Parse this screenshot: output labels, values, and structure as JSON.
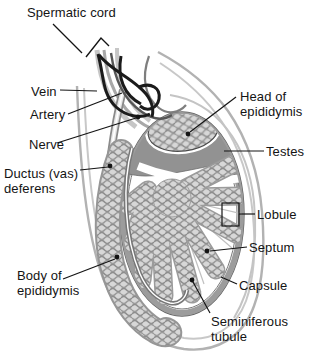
{
  "labels": {
    "spermatic_cord": "Spermatic cord",
    "vein": "Vein",
    "artery": "Artery",
    "nerve": "Nerve",
    "ductus_deferens": {
      "line1": "Ductus (vas)",
      "line2": "deferens"
    },
    "body_of_epididymis": {
      "line1": "Body of",
      "line2": "epididymis"
    },
    "head_of_epididymis": {
      "line1": "Head of",
      "line2": "epididymis"
    },
    "testes": "Testes",
    "lobule": "Lobule",
    "septum": "Septum",
    "capsule": "Capsule",
    "seminiferous_tubule": {
      "line1": "Seminiferous",
      "line2": "tubule"
    }
  },
  "colors": {
    "background": "#ffffff",
    "text": "#141414",
    "leader_line": "#141414",
    "capsule_gray": "#9c9c9c",
    "head_region_gray": "#929292",
    "tubule_fill": "#d7d7d7",
    "tubule_stroke": "#8d8d8d",
    "vein_black": "#1b1b1b",
    "artery_gray": "#565656",
    "nerve_gray": "#7e7e7e",
    "sac_outline": "#b2b2b2"
  }
}
